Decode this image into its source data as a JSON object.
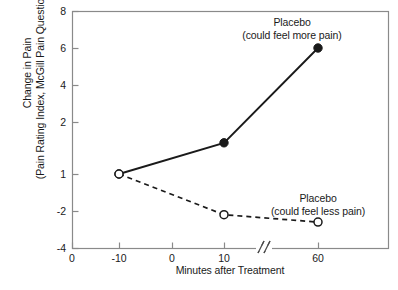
{
  "chart_data": {
    "type": "line",
    "title": "",
    "xlabel": "Minutes after Treatment",
    "ylabel_line1": "Change in Pain",
    "ylabel_line2": "(Pain Rating Index, McGill Pain Questionnaire)",
    "x_tick_labels": [
      "0",
      "-10",
      "0",
      "10",
      "60"
    ],
    "y_tick_labels": [
      "8",
      "6",
      "4",
      "2",
      "1",
      "-2",
      "-4"
    ],
    "y_tick_values": [
      8,
      6,
      4,
      2,
      1,
      -2,
      -4
    ],
    "ylim": [
      -4,
      8
    ],
    "xlim": [
      -10,
      60
    ],
    "axis_break": true,
    "axis_break_label": "//",
    "grid": false,
    "legend_position": "inline-annotations",
    "series": [
      {
        "name": "Placebo (could feel more pain)",
        "label_line1": "Placebo",
        "label_line2": "(could feel more pain)",
        "style": "solid",
        "marker": "filled-circle",
        "color": "#1a1a1a",
        "x": [
          -10,
          10,
          60
        ],
        "values": [
          1,
          1.6,
          6
        ]
      },
      {
        "name": "Placebo (could feel less pain)",
        "label_line1": "Placebo",
        "label_line2": "(could feel less pain)",
        "style": "dashed",
        "marker": "open-circle",
        "color": "#1a1a1a",
        "x": [
          -10,
          10,
          60
        ],
        "values": [
          1,
          -2.2,
          -2.6
        ]
      }
    ]
  },
  "figure": {
    "frame_color": "#888888",
    "caption_fragment": ""
  }
}
